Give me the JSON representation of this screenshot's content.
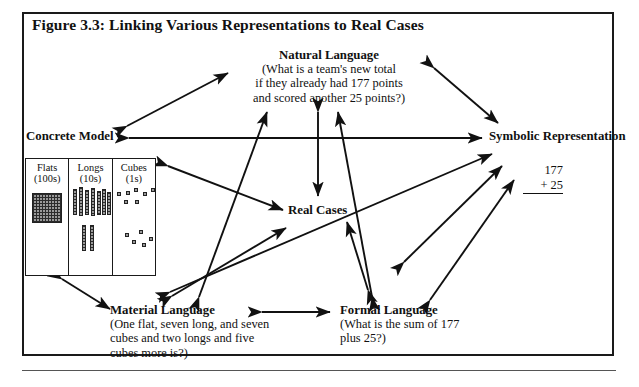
{
  "figure": {
    "title": "Figure 3.3:  Linking Various Representations to Real Cases"
  },
  "nodes": {
    "natural_language": {
      "title": "Natural Language",
      "line1": "(What is a team's new total",
      "line2": "if they already had 177 points",
      "line3": "and scored another 25 points?)"
    },
    "concrete_model": {
      "title": "Concrete Model"
    },
    "symbolic_representation": {
      "title": "Symbolic Representation",
      "sum_addend1": "177",
      "sum_addend2": "+ 25"
    },
    "real_cases": {
      "title": "Real Cases"
    },
    "material_language": {
      "title": "Material Language",
      "line1": "(One flat, seven long, and seven",
      "line2": "cubes and two longs and five",
      "line3": "cubes more is?)"
    },
    "formal_language": {
      "title": "Formal Language",
      "line1": "(What is the sum of 177",
      "line2": "plus 25?)"
    }
  },
  "manipulatives": {
    "columns": [
      {
        "name": "Flats",
        "place": "(100s)",
        "icon": "flat-grid-icon",
        "count": 1
      },
      {
        "name": "Longs",
        "place": "(10s)",
        "icon": "long-rod-icon",
        "count_top": 7,
        "count_bottom": 2
      },
      {
        "name": "Cubes",
        "place": "(1s)",
        "icon": "unit-cube-icon",
        "count_top": 7,
        "count_bottom": 5
      }
    ]
  },
  "arrows": {
    "description": "Double-headed arrows linking every representation node to the others",
    "count": 11,
    "color": "#111111"
  }
}
